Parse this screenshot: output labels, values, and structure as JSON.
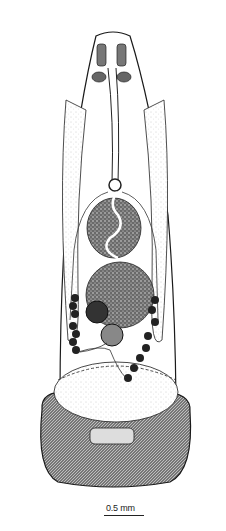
{
  "figure": {
    "colors": {
      "ink": "#1a1a1a",
      "stipple": "#555555",
      "paper": "#ffffff"
    }
  },
  "scale_bar": {
    "label": "0.5 mm",
    "length_px": 40
  }
}
